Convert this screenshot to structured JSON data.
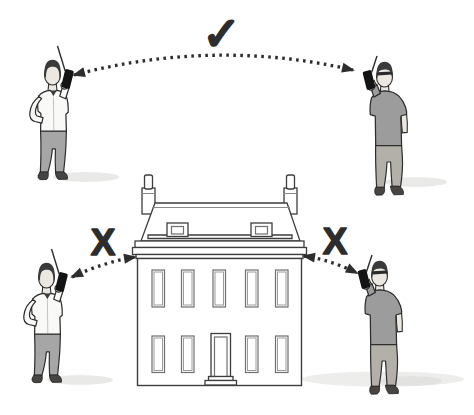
{
  "diagram": {
    "marks": {
      "clear": "✓",
      "blocked_left": "X",
      "blocked_right": "X"
    },
    "colors": {
      "ink": "#2d2d2d",
      "skin": "#ece7e0",
      "hair": "#3a3a3a",
      "shirt": "#f9f9f7",
      "tee": "#9c9c9c",
      "pants_a": "#a6a6a6",
      "pants_b": "#b3b0aa",
      "shoe": "#474441",
      "device": "#141414",
      "shadow": "#dcdcda",
      "building_line": "#3d3d3d",
      "window_frame": "#6f6f6f"
    }
  }
}
